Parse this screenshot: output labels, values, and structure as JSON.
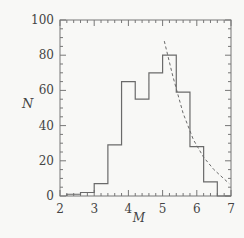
{
  "chart_data": {
    "type": "bar",
    "title": "",
    "xlabel": "M",
    "ylabel": "N",
    "xlim": [
      2,
      7
    ],
    "ylim": [
      0,
      100
    ],
    "x_ticks": [
      "2",
      "3",
      "4",
      "5",
      "6",
      "7"
    ],
    "y_ticks": [
      "0",
      "20",
      "40",
      "60",
      "80",
      "100"
    ],
    "grid": false,
    "legend": null,
    "bin_edges": [
      2.2,
      2.6,
      3.0,
      3.4,
      3.8,
      4.2,
      4.6,
      5.0,
      5.4,
      5.8,
      6.2,
      6.6,
      7.0
    ],
    "values": [
      1,
      2,
      7,
      29,
      65,
      55,
      70,
      80,
      59,
      28,
      8,
      0
    ],
    "series": [
      {
        "name": "histogram",
        "style": "step-solid",
        "values": [
          1,
          2,
          7,
          29,
          65,
          55,
          70,
          80,
          59,
          28,
          8,
          0
        ]
      },
      {
        "name": "fit",
        "style": "dashed-curve",
        "x": [
          5.05,
          5.3,
          5.6,
          5.9,
          6.2,
          6.5,
          6.95
        ],
        "y": [
          88,
          68,
          47,
          32,
          22,
          15,
          7
        ]
      }
    ]
  },
  "axes": {
    "xlabel": "M",
    "ylabel": "N"
  },
  "colors": {
    "line": "#6a6a6a",
    "axis": "#777777",
    "text": "#444444",
    "background": "#f8f8f6"
  }
}
